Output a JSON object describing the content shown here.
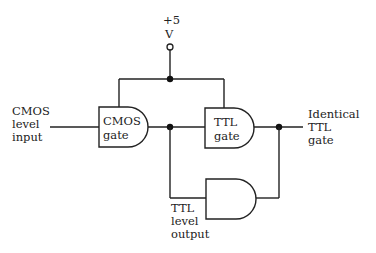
{
  "diagram": {
    "type": "logic-circuit",
    "title": "",
    "supply": {
      "line1": "+5",
      "line2": "V"
    },
    "input_label": [
      "CMOS",
      "level",
      "input"
    ],
    "gates": [
      {
        "id": "cmos",
        "type": "AND",
        "label_line1": "CMOS",
        "label_line2": "gate"
      },
      {
        "id": "ttl",
        "type": "AND",
        "label_line1": "TTL",
        "label_line2": "gate"
      },
      {
        "id": "identical",
        "type": "AND",
        "label_line1": "",
        "label_line2": ""
      }
    ],
    "output_label": [
      "TTL",
      "level",
      "output"
    ],
    "identical_label": [
      "Identical",
      "TTL",
      "gate"
    ],
    "colors": {
      "line": "#222222",
      "background": "#ffffff"
    }
  }
}
